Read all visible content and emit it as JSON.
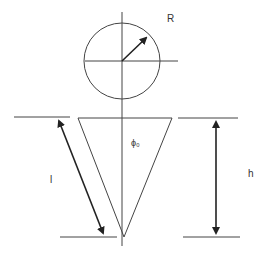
{
  "diagram": {
    "type": "cone-geometry",
    "labels": {
      "radius": "R",
      "slant": "l",
      "height": "h",
      "angle": "ϕ₀"
    },
    "colors": {
      "stroke": "#333333",
      "background": "#ffffff"
    }
  }
}
